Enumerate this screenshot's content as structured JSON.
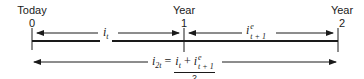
{
  "timeline": {
    "points": [
      {
        "label": "Today",
        "number": "0"
      },
      {
        "label": "Year",
        "number": "1"
      },
      {
        "label": "Year",
        "number": "2"
      }
    ]
  },
  "segments": {
    "first": {
      "symbol": "i",
      "subscript": "t",
      "superscript": ""
    },
    "second": {
      "symbol": "i",
      "subscript": "t + 1",
      "superscript": "e"
    }
  },
  "formula": {
    "lhs_symbol": "i",
    "lhs_subscript": "2t",
    "equals": "=",
    "term1_symbol": "i",
    "term1_subscript": "t",
    "plus": "+",
    "term2_symbol": "i",
    "term2_superscript": "e",
    "term2_subscript": "t + 1",
    "denominator": "2"
  },
  "colors": {
    "ink": "#1a1a1a",
    "background": "#ffffff"
  }
}
